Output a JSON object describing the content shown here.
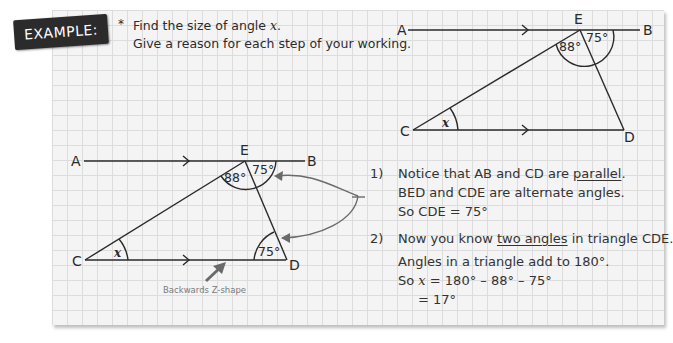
{
  "badge": {
    "label": "EXAMPLE:"
  },
  "intro": {
    "star": "*",
    "line1_prefix": "Find the size of angle ",
    "line1_var": "x",
    "line1_suffix": ".",
    "line2": "Give a reason for each step of your working."
  },
  "diagram_top": {
    "points": {
      "A": "A",
      "B": "B",
      "C": "C",
      "D": "D",
      "E": "E"
    },
    "angle_AEC": "88°",
    "angle_BED": "75°",
    "angle_x": "x"
  },
  "diagram_bottom": {
    "points": {
      "A": "A",
      "B": "B",
      "C": "C",
      "D": "D",
      "E": "E"
    },
    "angle_AEC": "88°",
    "angle_BED": "75°",
    "angle_CDE": "75°",
    "angle_x": "x",
    "annotation": "Backwards Z-shape"
  },
  "steps": [
    {
      "num": "1)",
      "lines": [
        {
          "prefix": "Notice that AB and CD are ",
          "underlined": "parallel",
          "suffix": "."
        },
        {
          "text": "BED and CDE are alternate angles."
        },
        {
          "text": "So CDE = 75°"
        }
      ]
    },
    {
      "num": "2)",
      "lines": [
        {
          "prefix": "Now you know ",
          "underlined": "two angles",
          "suffix": " in triangle CDE."
        },
        {
          "text": "Angles in a triangle add to 180°."
        },
        {
          "prefix": "So ",
          "var": "x",
          "suffix": " = 180° – 88° – 75°"
        },
        {
          "text": "= 17°"
        }
      ]
    }
  ],
  "colors": {
    "line": "#2a2a2a",
    "arrow": "#6a6a6a",
    "grid": "#dcdcdc",
    "paper": "#f4f4f4",
    "badge_bg": "#2b2b2b"
  }
}
